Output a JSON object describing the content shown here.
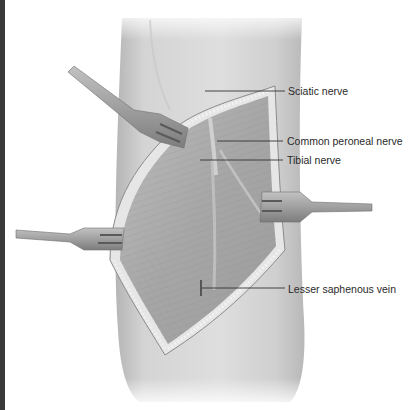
{
  "figure": {
    "labels": [
      {
        "id": "sciatic",
        "text": "Sciatic nerve"
      },
      {
        "id": "common-peroneal",
        "text": "Common peroneal nerve"
      },
      {
        "id": "tibial",
        "text": "Tibial nerve"
      },
      {
        "id": "lesser-saphenous",
        "text": "Lesser saphenous vein"
      }
    ],
    "retractor_count": 4,
    "colors": {
      "skin": "#d6d6d6",
      "skin_shadow": "#b8b8b8",
      "muscle": "#a9a9a9",
      "retractor": "#9a9a9a",
      "leader_line": "#333333",
      "edge_strip": "#3a3a3a"
    }
  }
}
